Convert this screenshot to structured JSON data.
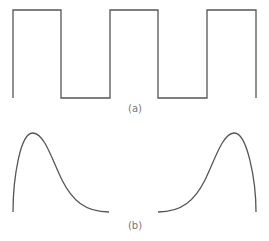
{
  "figure": {
    "panel_a": {
      "caption": "(a)",
      "shape": "square-wave",
      "stroke_color": "#555555",
      "points": [
        [
          13,
          98
        ],
        [
          13,
          10
        ],
        [
          61,
          10
        ],
        [
          61,
          98
        ],
        [
          110,
          98
        ],
        [
          110,
          10
        ],
        [
          158,
          10
        ],
        [
          158,
          98
        ],
        [
          207,
          98
        ],
        [
          207,
          10
        ],
        [
          256,
          10
        ],
        [
          256,
          98
        ]
      ]
    },
    "panel_b": {
      "caption": "(b)",
      "shape": "pulse-curves",
      "stroke_color": "#555555",
      "left_curve": "M13,212 C13,180 20,132 33,133 C45,134 52,160 62,180 C72,200 85,212 109,212",
      "right_curve": "M158,212 C182,212 195,200 205,180 C215,160 222,134 234,133 C247,132 256,180 256,212"
    }
  }
}
